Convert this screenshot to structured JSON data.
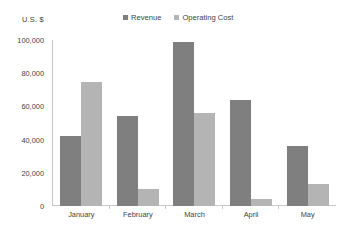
{
  "chart_data": {
    "type": "bar",
    "title": "",
    "subtitle": "",
    "xlabel": "",
    "ylabel": "U.S. $",
    "categories": [
      "January",
      "February",
      "March",
      "April",
      "May"
    ],
    "series": [
      {
        "name": "Revenue",
        "color": "#7f7f7f",
        "values": [
          42000,
          54000,
          99000,
          64000,
          36000
        ]
      },
      {
        "name": "Operating Cost",
        "color": "#b4b4b4",
        "values": [
          75000,
          10000,
          56000,
          4000,
          13000
        ]
      }
    ],
    "ylim": [
      0,
      100000
    ],
    "ytick_step": 20000,
    "ytick_labels": [
      "100,000",
      "80,000",
      "60,000",
      "40,000",
      "20,000",
      "0"
    ],
    "ytick_values": [
      100000,
      80000,
      60000,
      40000,
      20000,
      0
    ],
    "grid": false,
    "legend_position": "top-center"
  },
  "legend": {
    "entries": [
      {
        "label": "Revenue"
      },
      {
        "label": "Operating Cost"
      }
    ]
  },
  "axis": {
    "y_title": "U.S. $"
  }
}
